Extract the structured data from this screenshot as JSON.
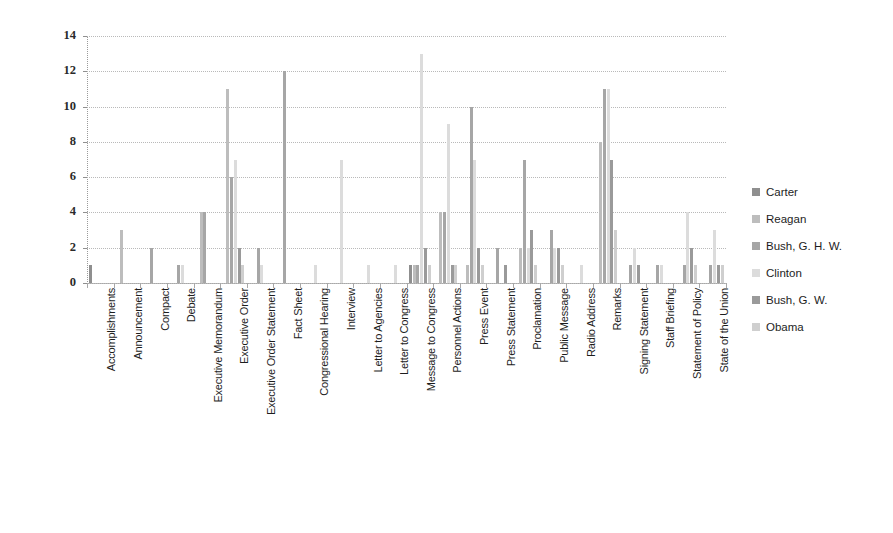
{
  "chart_data": {
    "type": "bar",
    "title": "",
    "xlabel": "",
    "ylabel": "",
    "ylim": [
      0,
      14
    ],
    "ytick_step": 2,
    "yticks": [
      0,
      2,
      4,
      6,
      8,
      10,
      12,
      14
    ],
    "grid": true,
    "legend_position": "right",
    "categories": [
      "Accomplishments",
      "Announcement",
      "Compact",
      "Debate",
      "Executive Memorandum",
      "Executive Order",
      "Executive Order Statement",
      "Fact Sheet",
      "Congressional Hearing",
      "Interview",
      "Letter to Agencies",
      "Letter to Congress",
      "Message to Congress",
      "Personnel Actions",
      "Press Event",
      "Press Statement",
      "Proclamation",
      "Public Message",
      "Radio Address",
      "Remarks",
      "Signing Statement",
      "Staff Briefing",
      "Statement of Policy",
      "State of the Union"
    ],
    "series": [
      {
        "name": "Carter",
        "color": "#8f8f8f",
        "values": [
          1,
          0,
          0,
          0,
          0,
          0,
          0,
          0,
          0,
          0,
          0,
          0,
          1,
          0,
          0,
          0,
          0,
          0,
          0,
          0,
          0,
          0,
          0,
          0
        ]
      },
      {
        "name": "Reagan",
        "color": "#bdbdbd",
        "values": [
          0,
          3,
          0,
          0,
          4,
          11,
          0,
          0,
          0,
          0,
          0,
          0,
          1,
          4,
          1,
          0,
          2,
          0,
          0,
          8,
          0,
          0,
          0,
          0
        ]
      },
      {
        "name": "Bush, G. H. W.",
        "color": "#a6a6a6",
        "values": [
          0,
          0,
          2,
          1,
          4,
          6,
          2,
          12,
          0,
          0,
          0,
          0,
          1,
          4,
          10,
          2,
          7,
          3,
          0,
          11,
          1,
          1,
          1,
          1
        ]
      },
      {
        "name": "Clinton",
        "color": "#dcdcdc",
        "values": [
          0,
          0,
          0,
          1,
          0,
          7,
          1,
          0,
          1,
          7,
          1,
          1,
          13,
          9,
          7,
          0,
          2,
          2,
          1,
          11,
          2,
          1,
          4,
          3
        ]
      },
      {
        "name": "Bush, G. W.",
        "color": "#9a9a9a",
        "values": [
          0,
          0,
          0,
          0,
          0,
          2,
          0,
          0,
          0,
          0,
          0,
          0,
          2,
          1,
          2,
          1,
          3,
          2,
          0,
          7,
          1,
          0,
          2,
          1
        ]
      },
      {
        "name": "Obama",
        "color": "#cfcfcf",
        "values": [
          0,
          0,
          0,
          0,
          0,
          1,
          0,
          0,
          0,
          0,
          0,
          0,
          1,
          1,
          1,
          0,
          1,
          1,
          0,
          3,
          0,
          0,
          1,
          1
        ]
      }
    ]
  },
  "legend": {
    "items": [
      {
        "label": "Carter"
      },
      {
        "label": "Reagan"
      },
      {
        "label": "Bush, G. H. W."
      },
      {
        "label": "Clinton"
      },
      {
        "label": "Bush, G. W."
      },
      {
        "label": "Obama"
      }
    ]
  }
}
